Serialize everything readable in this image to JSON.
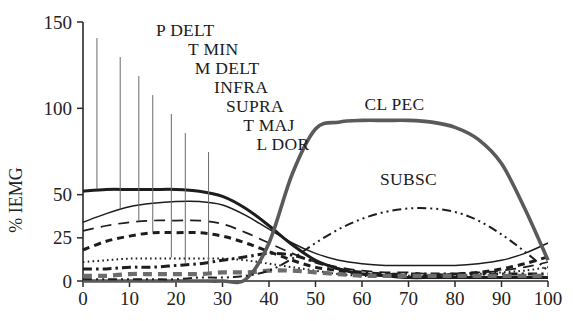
{
  "chart_data": {
    "type": "line",
    "title": "",
    "xlabel": "",
    "ylabel": "% IEMG",
    "xlim": [
      0,
      100
    ],
    "ylim": [
      0,
      150
    ],
    "grid": false,
    "legend_position": "inline-labels",
    "xticks": [
      "0",
      "10",
      "20",
      "30",
      "40",
      "50",
      "60",
      "70",
      "80",
      "90",
      "100"
    ],
    "xtick_values": [
      0,
      10,
      20,
      30,
      40,
      50,
      60,
      70,
      80,
      90,
      100
    ],
    "yticks": [
      "0",
      "25",
      "50",
      "100",
      "150"
    ],
    "ytick_values": [
      0,
      25,
      50,
      100,
      150
    ],
    "x": [
      0,
      5,
      10,
      15,
      20,
      25,
      30,
      35,
      40,
      45,
      50,
      55,
      60,
      65,
      70,
      75,
      80,
      85,
      90,
      95,
      100
    ],
    "series": [
      {
        "name": "P DELT",
        "label": "P DELT",
        "style": "solid-thick",
        "color": "#1d1d1d",
        "label_x": 22,
        "label_y": 143,
        "leader_to_x": 3,
        "values": [
          52,
          53,
          53,
          53,
          53,
          52,
          49,
          42,
          32,
          21,
          12,
          7,
          4,
          3,
          2,
          2,
          2,
          2,
          2,
          2,
          2
        ]
      },
      {
        "name": "T MIN",
        "label": "T MIN",
        "style": "solid-thin",
        "color": "#1d1d1d",
        "label_x": 28,
        "label_y": 132,
        "leader_to_x": 8,
        "values": [
          34,
          39,
          43,
          45,
          46,
          46,
          44,
          38,
          30,
          22,
          16,
          12,
          10,
          9,
          9,
          9,
          9,
          10,
          12,
          16,
          22
        ]
      },
      {
        "name": "M DELT",
        "label": "M DELT",
        "style": "dashed-long",
        "color": "#1d1d1d",
        "label_x": 31,
        "label_y": 121,
        "leader_to_x": 12,
        "values": [
          29,
          32,
          34,
          35,
          35,
          35,
          33,
          28,
          22,
          16,
          11,
          8,
          6,
          5,
          5,
          4,
          4,
          5,
          6,
          8,
          11
        ]
      },
      {
        "name": "INFRA",
        "label": "INFRA",
        "style": "dashed-thick-short",
        "color": "#1d1d1d",
        "label_x": 34,
        "label_y": 110,
        "leader_to_x": 15,
        "values": [
          18,
          23,
          26,
          28,
          28,
          28,
          26,
          22,
          17,
          12,
          8,
          6,
          4,
          4,
          3,
          3,
          4,
          5,
          7,
          10,
          14
        ]
      },
      {
        "name": "SUPRA",
        "label": "SUPRA",
        "style": "dotted-fine",
        "color": "#1d1d1d",
        "label_x": 37,
        "label_y": 99,
        "leader_to_x": 19,
        "values": [
          11,
          12,
          13,
          13,
          13,
          13,
          13,
          12,
          10,
          8,
          6,
          4,
          3,
          3,
          3,
          3,
          3,
          4,
          5,
          6,
          8
        ]
      },
      {
        "name": "T MAJ",
        "label": "T MAJ",
        "style": "dash-dot",
        "color": "#1d1d1d",
        "label_x": 40,
        "label_y": 88,
        "leader_to_x": 22,
        "values": [
          7,
          7,
          8,
          8,
          9,
          10,
          12,
          14,
          16,
          15,
          11,
          7,
          5,
          4,
          4,
          4,
          4,
          4,
          4,
          4,
          4
        ]
      },
      {
        "name": "L DOR",
        "label": "L DOR",
        "style": "dashed-thick-gray",
        "color": "#6c6c6c",
        "label_x": 43,
        "label_y": 77,
        "leader_to_x": 27,
        "values": [
          3,
          3,
          4,
          4,
          4,
          4,
          5,
          5,
          6,
          6,
          5,
          4,
          3,
          3,
          3,
          3,
          3,
          3,
          3,
          3,
          3
        ]
      },
      {
        "name": "CL PEC",
        "label": "CL PEC",
        "style": "solid-thick-gray",
        "color": "#5a5a5a",
        "label_x": 67,
        "label_y": 100,
        "leader_to_x": null,
        "values": [
          0,
          0,
          0,
          0,
          0,
          0,
          0,
          1,
          22,
          62,
          88,
          92,
          93,
          93,
          93,
          92,
          89,
          82,
          68,
          42,
          12
        ]
      },
      {
        "name": "SUBSC",
        "label": "SUBSC",
        "style": "dash-dot-dot",
        "color": "#1d1d1d",
        "label_x": 70,
        "label_y": 57,
        "leader_to_x": null,
        "values": [
          1,
          1,
          1,
          1,
          1,
          2,
          2,
          3,
          6,
          13,
          22,
          30,
          36,
          40,
          42,
          42,
          40,
          35,
          27,
          17,
          6
        ]
      }
    ]
  }
}
